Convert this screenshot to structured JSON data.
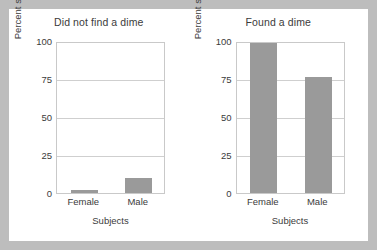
{
  "figure": {
    "frame_color": "#bdbdbd",
    "panel_color": "#ffffff"
  },
  "style": {
    "bar_color": "#9a9a9a",
    "grid_color": "#cfcfcf",
    "axis_color": "#c9c9c9",
    "text_color": "#3b3b3b"
  },
  "chart_data": [
    {
      "type": "bar",
      "title": "Did not find a dime",
      "xlabel": "Subjects",
      "ylabel": "Percent stopping to help",
      "categories": [
        "Female",
        "Male"
      ],
      "values": [
        2,
        10
      ],
      "ylim": [
        0,
        100
      ],
      "yticks": [
        0,
        25,
        50,
        75,
        100
      ],
      "ytick_labels": [
        "0",
        "25",
        "50",
        "75",
        "100"
      ],
      "grid": true,
      "gridlines": [
        25,
        50,
        75
      ],
      "legend": false
    },
    {
      "type": "bar",
      "title": "Found a dime",
      "xlabel": "Subjects",
      "ylabel": "Percent stopping to help",
      "categories": [
        "Female",
        "Male"
      ],
      "values": [
        100,
        76
      ],
      "ylim": [
        0,
        100
      ],
      "yticks": [
        0,
        25,
        50,
        75,
        100
      ],
      "ytick_labels": [
        "0",
        "25",
        "50",
        "75",
        "100"
      ],
      "grid": true,
      "gridlines": [
        25,
        50,
        75
      ],
      "legend": false
    }
  ]
}
